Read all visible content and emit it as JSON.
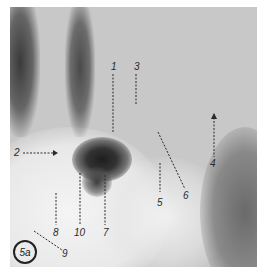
{
  "figure": {
    "id_badge": "5a",
    "type": "radiograph",
    "labels": [
      {
        "text": "1",
        "x": 112,
        "y": 63
      },
      {
        "text": "3",
        "x": 135,
        "y": 63
      },
      {
        "text": "2",
        "x": 14,
        "y": 147
      },
      {
        "text": "4",
        "x": 210,
        "y": 160
      },
      {
        "text": "5",
        "x": 157,
        "y": 199
      },
      {
        "text": "6",
        "x": 183,
        "y": 192
      },
      {
        "text": "7",
        "x": 103,
        "y": 229
      },
      {
        "text": "8",
        "x": 53,
        "y": 229
      },
      {
        "text": "9",
        "x": 58,
        "y": 250
      },
      {
        "text": "10",
        "x": 77,
        "y": 229
      }
    ]
  }
}
